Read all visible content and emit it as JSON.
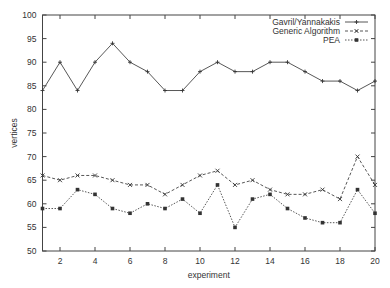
{
  "chart_data": {
    "type": "line",
    "title": "",
    "xlabel": "experiment",
    "ylabel": "vertices",
    "xlim": [
      1,
      20
    ],
    "ylim": [
      50,
      100
    ],
    "xticks": [
      2,
      4,
      6,
      8,
      10,
      12,
      14,
      16,
      18,
      20
    ],
    "yticks": [
      50,
      55,
      60,
      65,
      70,
      75,
      80,
      85,
      90,
      95,
      100
    ],
    "grid": false,
    "legend_position": "top-right",
    "x": [
      1,
      2,
      3,
      4,
      5,
      6,
      7,
      8,
      9,
      10,
      11,
      12,
      13,
      14,
      15,
      16,
      17,
      18,
      19,
      20
    ],
    "series": [
      {
        "name": "Gavril/Yannakakis",
        "style": "solid",
        "marker": "plus",
        "values": [
          84,
          90,
          84,
          90,
          94,
          90,
          88,
          84,
          84,
          88,
          90,
          88,
          88,
          90,
          90,
          88,
          86,
          86,
          84,
          86
        ]
      },
      {
        "name": "Generic Algorithm",
        "style": "dashed",
        "marker": "cross",
        "values": [
          66,
          65,
          66,
          66,
          65,
          64,
          64,
          62,
          64,
          66,
          67,
          64,
          65,
          63,
          62,
          62,
          63,
          61,
          70,
          64
        ]
      },
      {
        "name": "PEA",
        "style": "dotted",
        "marker": "square",
        "values": [
          59,
          59,
          63,
          62,
          59,
          58,
          60,
          59,
          61,
          58,
          64,
          55,
          61,
          62,
          59,
          57,
          56,
          56,
          63,
          58
        ]
      }
    ]
  }
}
